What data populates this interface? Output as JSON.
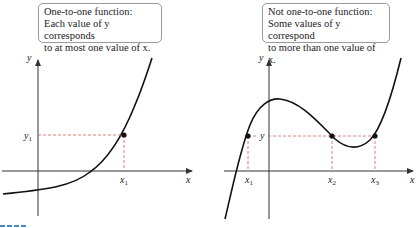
{
  "left_panel": {
    "caption_lines": [
      "One-to-one function:",
      "Each value of y corresponds",
      "to at most one value of x."
    ],
    "axis_labels": {
      "x": "x",
      "y": "y"
    },
    "point_labels": {
      "y": "y",
      "y_sub": "1",
      "x": "x",
      "x_sub": "1"
    }
  },
  "right_panel": {
    "caption_lines": [
      "Not one-to-one function:",
      "Some values of y correspond",
      "to more than one value of x."
    ],
    "axis_labels": {
      "x": "x",
      "y": "y"
    },
    "point_labels": {
      "y": "y",
      "x1": "x",
      "x1_sub": "1",
      "x2": "x",
      "x2_sub": "2",
      "x3": "x",
      "x3_sub": "3"
    }
  },
  "colors": {
    "curve": "#111111",
    "axis": "#333333",
    "guide": "#d0605a",
    "box_border": "#9a9a9a",
    "corner_mark": "#4a86c8"
  }
}
